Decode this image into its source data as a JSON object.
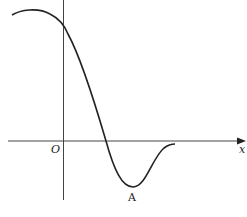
{
  "diagram": {
    "type": "function-graph",
    "labels": {
      "origin": "O",
      "x_axis": "x",
      "point": "A"
    },
    "colors": {
      "curve": "#222222",
      "axis": "#444444"
    }
  }
}
